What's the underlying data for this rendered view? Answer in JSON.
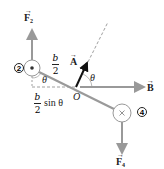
{
  "figure": {
    "type": "torque-on-current-loop-side-view",
    "labels": {
      "force_top": "F",
      "force_top_sub": "2",
      "force_bottom": "F",
      "force_bottom_sub": "4",
      "field": "B",
      "area_vector": "A",
      "pivot": "O",
      "angle_left": "θ",
      "angle_right": "θ",
      "half_length_num": "b",
      "half_length_den": "2",
      "moment_arm_num": "b",
      "moment_arm_den": "2",
      "moment_arm_suffix": "sin θ",
      "wire_top_id": "2",
      "wire_bottom_id": "4",
      "vector_arrow": "→"
    },
    "wire_top_symbol": "dot (current out of page)",
    "wire_bottom_symbol": "cross (current into page)",
    "colors": {
      "arrow_gray": "#999999",
      "rod_gray": "#9a9a9a",
      "area_arrow": "#111111",
      "text": "#222222",
      "dashed": "#888888"
    }
  }
}
